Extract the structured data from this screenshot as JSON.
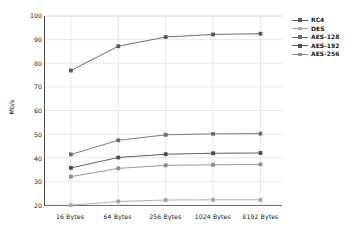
{
  "chart_data": {
    "type": "line",
    "title": "",
    "xlabel": "",
    "ylabel": "Mb/s",
    "categories": [
      "16 Bytes",
      "64 Bytes",
      "256 Bytes",
      "1024 Bytes",
      "8192 Bytes"
    ],
    "ylim": [
      20,
      100
    ],
    "yticks": [
      20,
      30,
      40,
      50,
      60,
      70,
      80,
      90,
      100
    ],
    "grid": true,
    "legend_position": "right-top",
    "series": [
      {
        "name": "RC4",
        "values": [
          76.9,
          87.2,
          91.1,
          92.2,
          92.5
        ],
        "color": "#595959"
      },
      {
        "name": "DES",
        "values": [
          19.9,
          21.5,
          22.1,
          22.2,
          22.2
        ],
        "color": "#a6a6a6"
      },
      {
        "name": "AES-128",
        "values": [
          41.4,
          47.4,
          49.7,
          50.1,
          50.2
        ],
        "color": "#6b6b6b"
      },
      {
        "name": "AES-192",
        "values": [
          35.7,
          40.1,
          41.5,
          41.9,
          42.0
        ],
        "color": "#4d4d4d"
      },
      {
        "name": "AES-256",
        "values": [
          32.0,
          35.5,
          36.8,
          37.0,
          37.2
        ],
        "color": "#8c8c8c"
      }
    ]
  },
  "axis": {
    "y_label": "Mb/s",
    "y_tick_labels": [
      "100",
      "90",
      "80",
      "70",
      "60",
      "50",
      "40",
      "30",
      "20"
    ],
    "x_tick_labels": [
      "16 Bytes",
      "64 Bytes",
      "256 Bytes",
      "1024 Bytes",
      "8192 Bytes"
    ]
  },
  "legend": {
    "items": [
      {
        "label": "RC4"
      },
      {
        "label": "DES"
      },
      {
        "label": "AES-128"
      },
      {
        "label": "AES-192"
      },
      {
        "label": "AES-256"
      }
    ]
  },
  "style": {
    "axis_color": "#4a4a4a",
    "grid_color": "#d9d9d9",
    "background": "#ffffff",
    "text_color": "#1a1a1a"
  }
}
